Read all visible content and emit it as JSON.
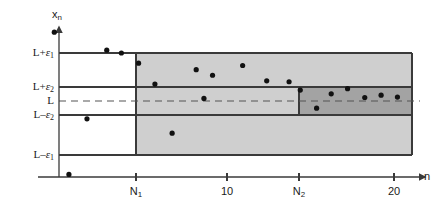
{
  "figure": {
    "axes": {
      "y_axis_name": "x",
      "y_axis_name_sub": "n",
      "x_axis_name": "n"
    },
    "colors": {
      "outer_band_fill": "#cfcfcf",
      "inner_band_fill": "#a3a3a3",
      "line_color": "#3a3a3a",
      "point_color": "#111111",
      "background": "#ffffff",
      "dashed_limit_color": "#555555"
    },
    "y_labels": [
      {
        "id": "L-plus-eps1",
        "lead": "L+",
        "sym": "ε",
        "sub": "1"
      },
      {
        "id": "L-plus-eps2",
        "lead": "L+",
        "sym": "ε",
        "sub": "2"
      },
      {
        "id": "L",
        "lead": "L",
        "sym": "",
        "sub": ""
      },
      {
        "id": "L-minus-eps2",
        "lead": "L–",
        "sym": "ε",
        "sub": "2"
      },
      {
        "id": "L-minus-eps1",
        "lead": "L–",
        "sym": "ε",
        "sub": "1"
      }
    ],
    "x_ticks": [
      {
        "id": "N1",
        "lead": "N",
        "sub": "1",
        "n": 5
      },
      {
        "id": "ten",
        "lead": "10",
        "sub": "",
        "n": 10
      },
      {
        "id": "N2",
        "lead": "N",
        "sub": "2",
        "n": 15
      },
      {
        "id": "twenty",
        "lead": "20",
        "sub": "",
        "n": 20
      }
    ]
  },
  "chart_data": {
    "type": "scatter",
    "xlabel": "n",
    "ylabel": "x_n",
    "grid": false,
    "legend": null,
    "xlim": [
      0,
      21.5
    ],
    "ylim": [
      -1.55,
      1.55
    ],
    "x_tick_values": [
      5,
      10,
      15,
      20
    ],
    "x_tick_labels": [
      "N₁",
      "10",
      "N₂",
      "20"
    ],
    "y_tick_values": [
      1.0,
      0.35,
      0.0,
      -0.35,
      -1.2
    ],
    "y_tick_labels": [
      "L+ε₁",
      "L+ε₂",
      "L",
      "L–ε₂",
      "L–ε₁"
    ],
    "limit_line": {
      "label": "L",
      "value": 0.0,
      "style": "dashed"
    },
    "bands": [
      {
        "name": "epsilon-1-band",
        "label": "outer band (ε₁)",
        "x_start": 5,
        "x_end": 20.6,
        "y_low": -1.2,
        "y_high": 1.0,
        "fill": "#cfcfcf"
      },
      {
        "name": "epsilon-2-band",
        "label": "inner band (ε₂)",
        "x_start": 15,
        "x_end": 20.6,
        "y_low": -0.35,
        "y_high": 0.35,
        "fill": "#a3a3a3"
      }
    ],
    "boundary_lines": [
      {
        "name": "L+eps1",
        "y": 1.0,
        "x_start": 0,
        "x_end": 20.6
      },
      {
        "name": "L+eps2",
        "y": 0.35,
        "x_start": 0,
        "x_end": 20.6
      },
      {
        "name": "L-eps2",
        "y": -0.35,
        "x_start": 0,
        "x_end": 20.6
      },
      {
        "name": "L-eps1",
        "y": -1.2,
        "x_start": 0,
        "x_end": 20.6
      }
    ],
    "series": [
      {
        "name": "x_n",
        "marker": "filled-circle",
        "points": [
          {
            "n": 0.25,
            "x": 1.45
          },
          {
            "n": 1.1,
            "x": -1.62
          },
          {
            "n": 2.15,
            "x": -0.42
          },
          {
            "n": 3.3,
            "x": 1.06
          },
          {
            "n": 4.15,
            "x": 1.0
          },
          {
            "n": 5.15,
            "x": 0.78
          },
          {
            "n": 6.1,
            "x": 0.33
          },
          {
            "n": 7.1,
            "x": -0.73
          },
          {
            "n": 8.5,
            "x": 0.64
          },
          {
            "n": 8.95,
            "x": 0.02
          },
          {
            "n": 9.45,
            "x": 0.52
          },
          {
            "n": 11.2,
            "x": 0.73
          },
          {
            "n": 12.6,
            "x": 0.4
          },
          {
            "n": 13.9,
            "x": 0.38
          },
          {
            "n": 14.55,
            "x": 0.2
          },
          {
            "n": 15.5,
            "x": -0.19
          },
          {
            "n": 16.35,
            "x": 0.12
          },
          {
            "n": 17.3,
            "x": 0.23
          },
          {
            "n": 18.3,
            "x": 0.04
          },
          {
            "n": 19.25,
            "x": 0.09
          },
          {
            "n": 20.2,
            "x": 0.05
          }
        ]
      }
    ]
  }
}
